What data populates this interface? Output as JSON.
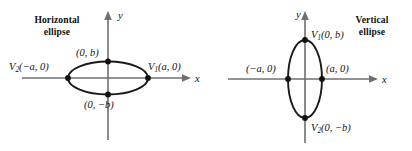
{
  "figure": {
    "kind": "ellipse-standard-forms-diagram",
    "background_color": "#ffffff",
    "axis_color": "#6f6f6f",
    "curve_color": "#1a1a1a",
    "vertex_color": "#111111"
  },
  "panels": [
    {
      "id": "horizontal",
      "caption_line1": "Horizontal",
      "caption_line2": "ellipse",
      "axes": {
        "x_label": "x",
        "y_label": "y"
      },
      "vertices": [
        {
          "name": "left-vertex",
          "v": "V",
          "sub": "2",
          "coords": "(−a, 0)",
          "full": "V2(−a, 0)"
        },
        {
          "name": "right-vertex",
          "v": "V",
          "sub": "1",
          "coords": "(a, 0)",
          "full": "V1(a, 0)"
        },
        {
          "name": "top-covertex",
          "v": "",
          "sub": "",
          "coords": "(0, b)",
          "full": "(0, b)"
        },
        {
          "name": "bottom-covertex",
          "v": "",
          "sub": "",
          "coords": "(0, −b)",
          "full": "(0, −b)"
        }
      ]
    },
    {
      "id": "vertical",
      "caption_line1": "Vertical",
      "caption_line2": "ellipse",
      "axes": {
        "x_label": "x",
        "y_label": "y"
      },
      "vertices": [
        {
          "name": "top-vertex",
          "v": "V",
          "sub": "1",
          "coords": "(0, b)",
          "full": "V1(0, b)"
        },
        {
          "name": "bottom-vertex",
          "v": "V",
          "sub": "2",
          "coords": "(0, −b)",
          "full": "V2(0, −b)"
        },
        {
          "name": "left-covertex",
          "v": "",
          "sub": "",
          "coords": "(−a, 0)",
          "full": "(−a, 0)"
        },
        {
          "name": "right-covertex",
          "v": "",
          "sub": "",
          "coords": "(a, 0)",
          "full": "(a, 0)"
        }
      ]
    }
  ]
}
